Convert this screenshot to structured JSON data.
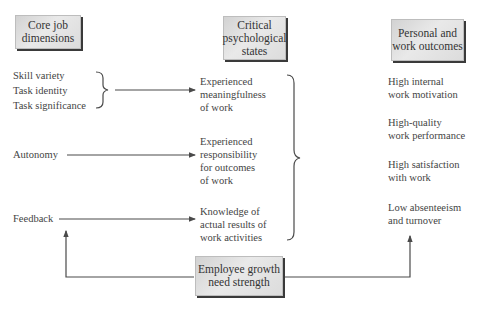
{
  "headers": {
    "core": "Core job dimensions",
    "core_l1": "Core job",
    "core_l2": "dimensions",
    "critical_l1": "Critical",
    "critical_l2": "psychological",
    "critical_l3": "states",
    "outcomes_l1": "Personal and",
    "outcomes_l2": "work outcomes"
  },
  "core_dimensions": [
    {
      "label": "Skill variety"
    },
    {
      "label": "Task identity"
    },
    {
      "label": "Task significance"
    },
    {
      "label": "Autonomy"
    },
    {
      "label": "Feedback"
    }
  ],
  "psychological_states": [
    {
      "l1": "Experienced",
      "l2": "meaningfulness",
      "l3": "of work"
    },
    {
      "l1": "Experienced",
      "l2": "responsibility",
      "l3": "for outcomes",
      "l4": "of work"
    },
    {
      "l1": "Knowledge of",
      "l2": "actual results of",
      "l3": "work activities"
    }
  ],
  "outcomes": [
    {
      "l1": "High internal",
      "l2": "work motivation"
    },
    {
      "l1": "High-quality",
      "l2": "work performance"
    },
    {
      "l1": "High satisfaction",
      "l2": "with work"
    },
    {
      "l1": "Low absenteeism",
      "l2": "and turnover"
    }
  ],
  "moderator": {
    "l1": "Employee growth",
    "l2": "need strength"
  },
  "colors": {
    "line": "#4a4a4a",
    "box_shadow": "#3a3a3a",
    "box_fill": "#e2e2e2"
  }
}
